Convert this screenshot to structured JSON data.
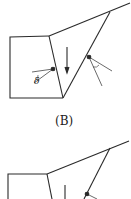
{
  "figures": [
    {
      "caption": "(B)",
      "angle_symbol": "δ"
    },
    {
      "caption": ""
    }
  ],
  "colors": {
    "stroke": "#2a2a2a",
    "background": "#ffffff"
  }
}
